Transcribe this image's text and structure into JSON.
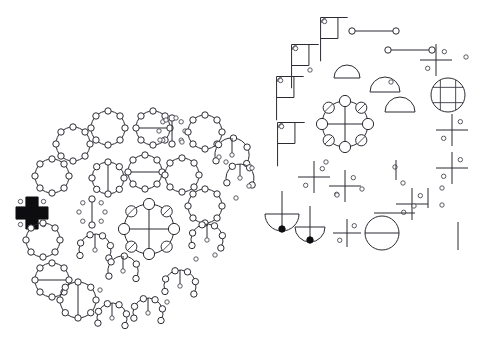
{
  "figure": {
    "title": "Abstract geometric glyph field",
    "background_color": "#ffffff",
    "stroke_color": "#2b2b33",
    "accent_fill_color": "#0d0d10",
    "node_fill_color": "#ffffff",
    "width": 490,
    "height": 349,
    "cluster_count": 2,
    "caption": ""
  },
  "clusters": [
    {
      "name": "left-cluster",
      "label": "Left radial cluster",
      "center_x": 120,
      "center_y": 222,
      "glyph_count": 31
    },
    {
      "name": "right-cluster",
      "label": "Right radial cluster",
      "center_x": 370,
      "center_y": 130,
      "glyph_count": 34
    }
  ],
  "glyph_types": [
    {
      "key": "ring8",
      "label": "Ring of eight nodes"
    },
    {
      "key": "ring8-hbar",
      "label": "Ring of eight nodes with horizontal diameter"
    },
    {
      "key": "ring8-vbar",
      "label": "Ring of eight nodes with vertical diameter"
    },
    {
      "key": "ring8-cross",
      "label": "Ring of eight nodes with crossed diameters"
    },
    {
      "key": "dots8",
      "label": "Eight free nodes in ring formation"
    },
    {
      "key": "arc-nodes",
      "label": "Open arc of nodes"
    },
    {
      "key": "filled-plus",
      "label": "Solid plus with quadrant nodes"
    },
    {
      "key": "flag",
      "label": "Flag with corner arc"
    },
    {
      "key": "half-disk",
      "label": "Half disk"
    },
    {
      "key": "grid-circle",
      "label": "Circle with lattice grid"
    },
    {
      "key": "cross-dots",
      "label": "Cross with quadrant nodes"
    },
    {
      "key": "bar-nodes",
      "label": "Bar terminated by nodes"
    },
    {
      "key": "circle-hbar",
      "label": "Circle with horizontal chord"
    },
    {
      "key": "pendulum",
      "label": "Half disk with vertical stem"
    }
  ],
  "left_cluster_glyphs": [
    {
      "id": "L01",
      "type": "ring8",
      "x": 108,
      "y": 128,
      "r": 17,
      "nodes": 8
    },
    {
      "id": "L02",
      "type": "ring8-hbar",
      "x": 153,
      "y": 128,
      "r": 17,
      "nodes": 8
    },
    {
      "id": "L03",
      "type": "dots8",
      "x": 172,
      "y": 131,
      "r": 13,
      "nodes": 8
    },
    {
      "id": "L04",
      "type": "ring8",
      "x": 205,
      "y": 132,
      "r": 17,
      "nodes": 8
    },
    {
      "id": "L05",
      "type": "ring8",
      "x": 73,
      "y": 144,
      "r": 17,
      "nodes": 8
    },
    {
      "id": "L06",
      "type": "arc-nodes",
      "x": 232,
      "y": 155,
      "r": 17,
      "nodes": 5
    },
    {
      "id": "L07",
      "type": "ring8",
      "x": 52,
      "y": 176,
      "r": 17,
      "nodes": 8
    },
    {
      "id": "L08",
      "type": "ring8-vbar",
      "x": 108,
      "y": 178,
      "r": 16,
      "nodes": 8
    },
    {
      "id": "L09",
      "type": "ring8-hbar",
      "x": 145,
      "y": 172,
      "r": 17,
      "nodes": 8
    },
    {
      "id": "L10",
      "type": "ring8",
      "x": 182,
      "y": 175,
      "r": 17,
      "nodes": 8
    },
    {
      "id": "L11",
      "type": "arc-nodes",
      "x": 240,
      "y": 178,
      "r": 14,
      "nodes": 4
    },
    {
      "id": "L12",
      "type": "dots8",
      "x": 92,
      "y": 212,
      "r": 13,
      "nodes": 8
    },
    {
      "id": "L13",
      "type": "ring8-cross",
      "x": 149,
      "y": 229,
      "r": 25,
      "nodes": 8
    },
    {
      "id": "L14",
      "type": "filled-plus",
      "x": 32,
      "y": 213,
      "r": 16,
      "nodes": 4
    },
    {
      "id": "L15",
      "type": "ring8",
      "x": 205,
      "y": 206,
      "r": 17,
      "nodes": 8
    },
    {
      "id": "L16",
      "type": "arc-nodes",
      "x": 207,
      "y": 240,
      "r": 16,
      "nodes": 6
    },
    {
      "id": "L17",
      "type": "ring8",
      "x": 43,
      "y": 240,
      "r": 17,
      "nodes": 8
    },
    {
      "id": "L18",
      "type": "arc-nodes",
      "x": 95,
      "y": 250,
      "r": 16,
      "nodes": 6
    },
    {
      "id": "L19",
      "type": "arc-nodes",
      "x": 123,
      "y": 271,
      "r": 15,
      "nodes": 5
    },
    {
      "id": "L20",
      "type": "ring8-hbar",
      "x": 52,
      "y": 280,
      "r": 17,
      "nodes": 8
    },
    {
      "id": "L21",
      "type": "ring8-vbar",
      "x": 78,
      "y": 300,
      "r": 18,
      "nodes": 8
    },
    {
      "id": "L22",
      "type": "arc-nodes",
      "x": 180,
      "y": 286,
      "r": 16,
      "nodes": 6
    },
    {
      "id": "L23",
      "type": "arc-nodes",
      "x": 112,
      "y": 318,
      "r": 15,
      "nodes": 6
    },
    {
      "id": "L24",
      "type": "arc-nodes",
      "x": 148,
      "y": 313,
      "r": 15,
      "nodes": 6
    }
  ],
  "right_cluster_glyphs": [
    {
      "id": "R01",
      "type": "flag",
      "x": 326,
      "y": 35,
      "r": 14
    },
    {
      "id": "R02",
      "type": "bar-nodes",
      "x": 374,
      "y": 31,
      "r": 22
    },
    {
      "id": "R03",
      "type": "bar-nodes",
      "x": 410,
      "y": 50,
      "r": 22
    },
    {
      "id": "R04",
      "type": "flag",
      "x": 297,
      "y": 62,
      "r": 14
    },
    {
      "id": "R05",
      "type": "cross-dots",
      "x": 436,
      "y": 60,
      "r": 16
    },
    {
      "id": "R06",
      "type": "half-disk",
      "x": 347,
      "y": 78,
      "r": 13
    },
    {
      "id": "R07",
      "type": "flag",
      "x": 282,
      "y": 94,
      "r": 14
    },
    {
      "id": "R08",
      "type": "half-disk",
      "x": 385,
      "y": 92,
      "r": 15
    },
    {
      "id": "R09",
      "type": "grid-circle",
      "x": 448,
      "y": 95,
      "r": 17
    },
    {
      "id": "R10",
      "type": "ring8-cross",
      "x": 345,
      "y": 124,
      "r": 23
    },
    {
      "id": "R11",
      "type": "half-disk",
      "x": 400,
      "y": 112,
      "r": 15
    },
    {
      "id": "R12",
      "type": "flag",
      "x": 283,
      "y": 140,
      "r": 14
    },
    {
      "id": "R13",
      "type": "cross-dots",
      "x": 452,
      "y": 130,
      "r": 16
    },
    {
      "id": "R14",
      "type": "cross-dots",
      "x": 314,
      "y": 177,
      "r": 16
    },
    {
      "id": "R15",
      "type": "cross-dots",
      "x": 345,
      "y": 186,
      "r": 16
    },
    {
      "id": "R16",
      "type": "cross-dots",
      "x": 452,
      "y": 168,
      "r": 16
    },
    {
      "id": "R17",
      "type": "pendulum",
      "x": 282,
      "y": 218,
      "r": 17
    },
    {
      "id": "R18",
      "type": "pendulum",
      "x": 310,
      "y": 231,
      "r": 15
    },
    {
      "id": "R19",
      "type": "cross-dots",
      "x": 347,
      "y": 233,
      "r": 14
    },
    {
      "id": "R20",
      "type": "circle-hbar",
      "x": 382,
      "y": 233,
      "r": 17
    },
    {
      "id": "R21",
      "type": "cross-dots",
      "x": 412,
      "y": 204,
      "r": 16
    }
  ],
  "meta": {
    "node_radius_small": 2.2,
    "node_radius_medium": 3.2,
    "node_radius_large": 4.2,
    "line_width": 1
  }
}
